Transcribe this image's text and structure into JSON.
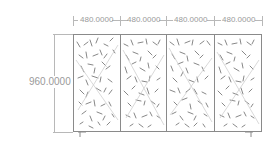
{
  "drawing": {
    "dimensions": {
      "widths": [
        "480.0000",
        "480.0000",
        "480.0000",
        "480.0000"
      ],
      "height": "960.0000"
    },
    "panels": [
      {
        "id": 1,
        "pattern": "random-perforation"
      },
      {
        "id": 2,
        "pattern": "random-perforation"
      },
      {
        "id": 3,
        "pattern": "random-perforation"
      },
      {
        "id": 4,
        "pattern": "random-perforation"
      }
    ],
    "colors": {
      "line": "#8a8a8a",
      "dimension": "#9a9a9a",
      "background": "#ffffff"
    }
  }
}
